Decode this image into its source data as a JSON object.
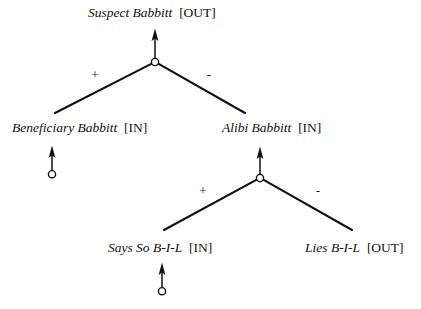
{
  "diagram": {
    "type": "argument-tree",
    "colors": {
      "ink": "#101010",
      "background": "#ffffff"
    },
    "nodes": [
      {
        "id": "suspect-babbitt",
        "name": "Suspect Babbitt",
        "state": "[OUT]",
        "separator": " "
      },
      {
        "id": "beneficiary-babbitt",
        "name": "Beneficiary Babbitt",
        "state": "[IN]",
        "separator": " "
      },
      {
        "id": "alibi-babbitt",
        "name": "Alibi Babbitt",
        "state": "[IN]",
        "separator": " "
      },
      {
        "id": "says-so-bil",
        "name": "Says So B-I-L",
        "state": "[IN]",
        "separator": " "
      },
      {
        "id": "lies-bil",
        "name": "Lies B-I-L",
        "state": "[OUT]",
        "separator": " "
      }
    ],
    "signs": {
      "upper_left": "+",
      "upper_right": "-",
      "lower_left": "+",
      "lower_right": "-"
    }
  }
}
